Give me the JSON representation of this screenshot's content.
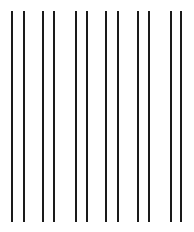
{
  "canvas": {
    "width": 194,
    "height": 232,
    "background": "#ffffff"
  },
  "lines": {
    "color": "#1a1a1a",
    "top": 11,
    "bottom": 222,
    "thickness": 2,
    "x_positions": [
      12,
      24,
      43,
      54,
      76,
      87,
      106,
      118,
      138,
      149,
      171,
      181
    ]
  }
}
